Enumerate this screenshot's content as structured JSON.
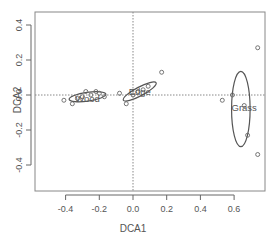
{
  "chart_data": {
    "type": "scatter",
    "title": "",
    "xlabel": "DCA1",
    "ylabel": "DCA2",
    "xlim": [
      -0.45,
      0.78
    ],
    "ylim": [
      -0.55,
      0.48
    ],
    "xticks": [
      -0.4,
      -0.2,
      0.0,
      0.2,
      0.4,
      0.6
    ],
    "xtick_labels": [
      "-0.4",
      "-0.2",
      "0.0",
      "0.2",
      "0.4",
      "0.6"
    ],
    "yticks": [
      -0.4,
      -0.2,
      0.0,
      0.2,
      0.4
    ],
    "ytick_labels": [
      "-0.4",
      "-0.2",
      "0.0",
      "0.2",
      "0.4"
    ],
    "grid": false,
    "reference_lines": {
      "x": 0.0,
      "y": 0.0,
      "style": "dotted"
    },
    "series": [
      {
        "name": "Wood",
        "points": [
          {
            "x": -0.41,
            "y": -0.03
          },
          {
            "x": -0.36,
            "y": -0.05
          },
          {
            "x": -0.33,
            "y": -0.02
          },
          {
            "x": -0.3,
            "y": -0.01
          },
          {
            "x": -0.28,
            "y": 0.02
          },
          {
            "x": -0.25,
            "y": 0.0
          },
          {
            "x": -0.22,
            "y": 0.02
          },
          {
            "x": -0.2,
            "y": 0.01
          },
          {
            "x": -0.17,
            "y": -0.01
          }
        ],
        "ellipse": {
          "cx": -0.27,
          "cy": -0.01,
          "rx": 0.11,
          "ry": 0.025,
          "angle_deg": -8
        },
        "label_pos": {
          "x": -0.27,
          "y": -0.02
        }
      },
      {
        "name": "Edge",
        "points": [
          {
            "x": -0.08,
            "y": 0.01
          },
          {
            "x": -0.04,
            "y": -0.05
          },
          {
            "x": 0.0,
            "y": 0.0
          },
          {
            "x": 0.03,
            "y": 0.02
          },
          {
            "x": 0.06,
            "y": 0.03
          },
          {
            "x": 0.09,
            "y": 0.05
          },
          {
            "x": 0.17,
            "y": 0.13
          }
        ],
        "ellipse": {
          "cx": 0.04,
          "cy": 0.02,
          "rx": 0.11,
          "ry": 0.025,
          "angle_deg": -28
        },
        "label_pos": {
          "x": 0.04,
          "y": 0.02
        }
      },
      {
        "name": "Grass",
        "points": [
          {
            "x": 0.74,
            "y": 0.27
          },
          {
            "x": 0.53,
            "y": -0.03
          },
          {
            "x": 0.59,
            "y": 0.0
          },
          {
            "x": 0.66,
            "y": -0.06
          },
          {
            "x": 0.68,
            "y": -0.23
          },
          {
            "x": 0.74,
            "y": -0.34
          }
        ],
        "ellipse": {
          "cx": 0.64,
          "cy": -0.08,
          "rx": 0.055,
          "ry": 0.215,
          "angle_deg": 0
        },
        "label_pos": {
          "x": 0.66,
          "y": -0.07
        }
      }
    ],
    "legend": null
  },
  "colors": {
    "axis": "#666666",
    "points": "#666666",
    "ellipse": "#555555",
    "text": "#555555",
    "reference_line": "#888888"
  }
}
